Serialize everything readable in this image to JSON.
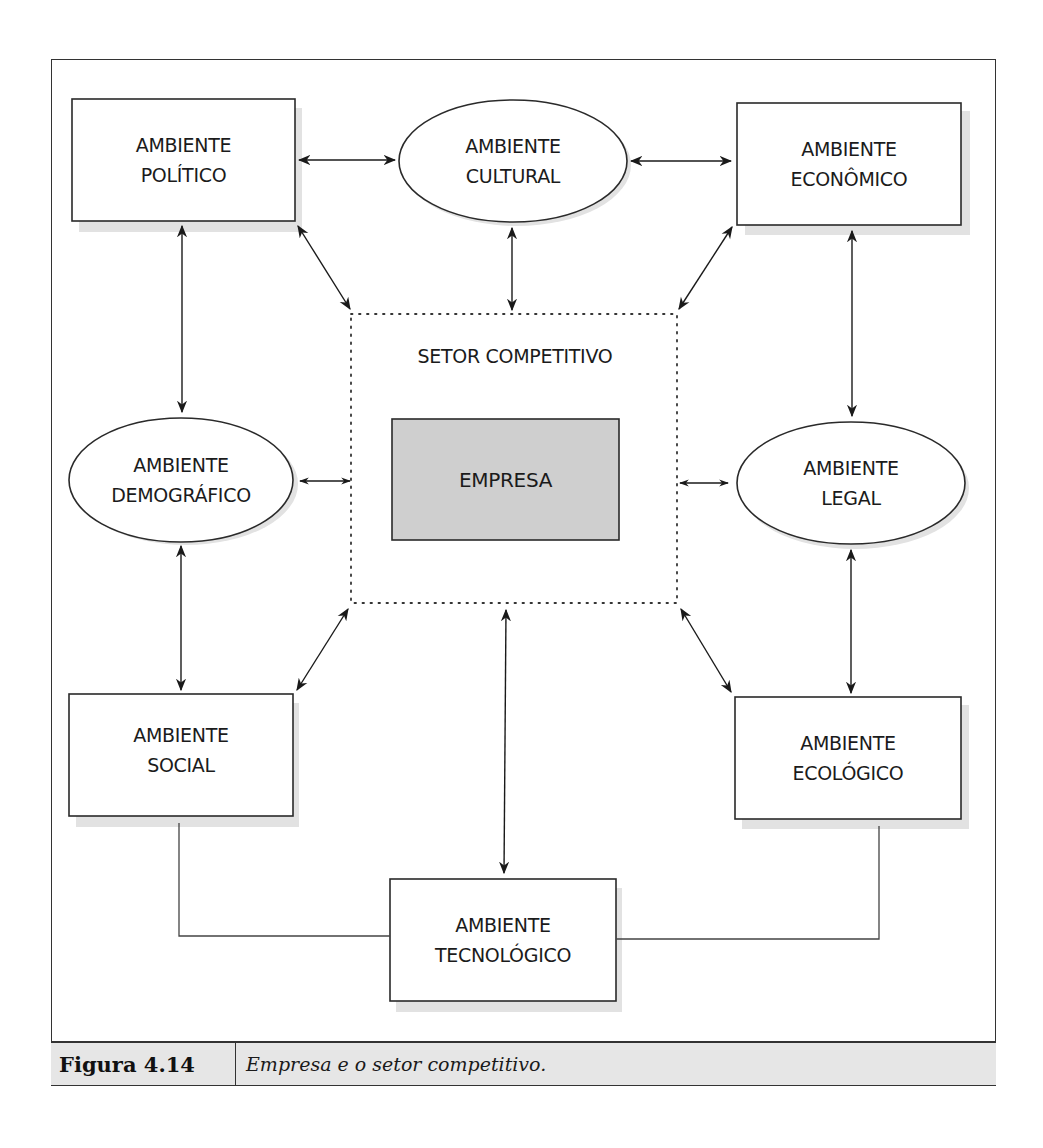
{
  "diagram": {
    "sector_title": "SETOR COMPETITIVO",
    "center": {
      "label": "EMPRESA",
      "fill": "#cfcfcf"
    },
    "nodes": {
      "politico": {
        "line1": "AMBIENTE",
        "line2": "POLÍTICO",
        "shape": "rect"
      },
      "cultural": {
        "line1": "AMBIENTE",
        "line2": "CULTURAL",
        "shape": "ellipse"
      },
      "economico": {
        "line1": "AMBIENTE",
        "line2": "ECONÔMICO",
        "shape": "rect"
      },
      "demografico": {
        "line1": "AMBIENTE",
        "line2": "DEMOGRÁFICO",
        "shape": "ellipse"
      },
      "legal": {
        "line1": "AMBIENTE",
        "line2": "LEGAL",
        "shape": "ellipse"
      },
      "social": {
        "line1": "AMBIENTE",
        "line2": "SOCIAL",
        "shape": "rect"
      },
      "ecologico": {
        "line1": "AMBIENTE",
        "line2": "ECOLÓGICO",
        "shape": "rect"
      },
      "tecnologico": {
        "line1": "AMBIENTE",
        "line2": "TECNOLÓGICO",
        "shape": "rect"
      }
    },
    "connections": [
      [
        "politico",
        "cultural"
      ],
      [
        "cultural",
        "economico"
      ],
      [
        "politico",
        "demografico"
      ],
      [
        "economico",
        "legal"
      ],
      [
        "demografico",
        "social"
      ],
      [
        "legal",
        "ecologico"
      ],
      [
        "politico",
        "setor"
      ],
      [
        "cultural",
        "setor"
      ],
      [
        "economico",
        "setor"
      ],
      [
        "demografico",
        "setor"
      ],
      [
        "legal",
        "setor"
      ],
      [
        "social",
        "setor"
      ],
      [
        "ecologico",
        "setor"
      ],
      [
        "tecnologico",
        "setor"
      ],
      [
        "social",
        "tecnologico"
      ],
      [
        "ecologico",
        "tecnologico"
      ]
    ]
  },
  "caption": {
    "number": "Figura 4.14",
    "text": "Empresa e o setor competitivo."
  }
}
